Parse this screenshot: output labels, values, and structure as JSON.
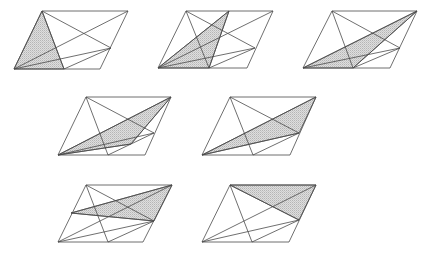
{
  "caption_fragment": "",
  "style": {
    "stroke": "#4a4a4a",
    "shade": "#cccccc"
  },
  "figures": [
    {
      "id": "fig1",
      "points": {
        "A": [
          14,
          69
        ],
        "B": [
          100,
          69
        ],
        "C": [
          128,
          11
        ],
        "D": [
          42,
          11
        ],
        "E": [
          64,
          69
        ],
        "F": [
          111,
          48
        ]
      },
      "lines": [
        [
          "A",
          "B"
        ],
        [
          "B",
          "C"
        ],
        [
          "C",
          "D"
        ],
        [
          "D",
          "A"
        ],
        [
          "D",
          "E"
        ],
        [
          "D",
          "F"
        ],
        [
          "A",
          "C"
        ],
        [
          "A",
          "F"
        ],
        [
          "E",
          "F"
        ]
      ],
      "shaded": [
        "A",
        "D",
        "E"
      ]
    },
    {
      "id": "fig2",
      "points": {
        "A": [
          158,
          68
        ],
        "B": [
          247,
          68
        ],
        "C": [
          273,
          11
        ],
        "D": [
          186,
          11
        ],
        "E": [
          209,
          68
        ],
        "F": [
          255,
          48
        ],
        "G": [
          229,
          11
        ]
      },
      "lines": [
        [
          "A",
          "B"
        ],
        [
          "B",
          "C"
        ],
        [
          "C",
          "D"
        ],
        [
          "D",
          "A"
        ],
        [
          "D",
          "E"
        ],
        [
          "D",
          "F"
        ],
        [
          "A",
          "C"
        ],
        [
          "A",
          "F"
        ],
        [
          "E",
          "F"
        ],
        [
          "A",
          "G"
        ],
        [
          "G",
          "E"
        ]
      ],
      "shaded": [
        "A",
        "G",
        "E"
      ]
    },
    {
      "id": "fig3",
      "points": {
        "A": [
          303,
          68
        ],
        "B": [
          390,
          68
        ],
        "C": [
          417,
          11
        ],
        "D": [
          332,
          11
        ],
        "E": [
          353,
          68
        ],
        "F": [
          400,
          48
        ]
      },
      "lines": [
        [
          "A",
          "B"
        ],
        [
          "B",
          "C"
        ],
        [
          "C",
          "D"
        ],
        [
          "D",
          "A"
        ],
        [
          "D",
          "E"
        ],
        [
          "D",
          "F"
        ],
        [
          "A",
          "C"
        ],
        [
          "A",
          "F"
        ],
        [
          "E",
          "F"
        ],
        [
          "E",
          "C"
        ]
      ],
      "shaded": [
        "A",
        "C",
        "E"
      ]
    },
    {
      "id": "fig4",
      "points": {
        "A": [
          58,
          155
        ],
        "B": [
          145,
          155
        ],
        "C": [
          171,
          97
        ],
        "D": [
          86,
          97
        ],
        "E": [
          108,
          155
        ],
        "F": [
          154,
          133
        ],
        "H": [
          131,
          144
        ]
      },
      "lines": [
        [
          "A",
          "B"
        ],
        [
          "B",
          "C"
        ],
        [
          "C",
          "D"
        ],
        [
          "D",
          "A"
        ],
        [
          "D",
          "E"
        ],
        [
          "D",
          "F"
        ],
        [
          "A",
          "C"
        ],
        [
          "A",
          "F"
        ],
        [
          "E",
          "F"
        ],
        [
          "A",
          "H"
        ],
        [
          "H",
          "C"
        ]
      ],
      "shaded": [
        "A",
        "C",
        "H"
      ]
    },
    {
      "id": "fig5",
      "points": {
        "A": [
          202,
          155
        ],
        "B": [
          290,
          155
        ],
        "C": [
          316,
          97
        ],
        "D": [
          230,
          97
        ],
        "E": [
          253,
          155
        ],
        "F": [
          299,
          133
        ]
      },
      "lines": [
        [
          "A",
          "B"
        ],
        [
          "B",
          "C"
        ],
        [
          "C",
          "D"
        ],
        [
          "D",
          "A"
        ],
        [
          "D",
          "E"
        ],
        [
          "D",
          "F"
        ],
        [
          "A",
          "C"
        ],
        [
          "A",
          "F"
        ],
        [
          "E",
          "F"
        ]
      ],
      "shaded": [
        "A",
        "C",
        "F"
      ]
    },
    {
      "id": "fig6",
      "points": {
        "A": [
          58,
          242
        ],
        "B": [
          143,
          242
        ],
        "C": [
          172,
          185
        ],
        "D": [
          86,
          185
        ],
        "E": [
          108,
          242
        ],
        "F": [
          154,
          221
        ],
        "G": [
          71,
          213
        ]
      },
      "lines": [
        [
          "A",
          "B"
        ],
        [
          "B",
          "C"
        ],
        [
          "C",
          "D"
        ],
        [
          "D",
          "A"
        ],
        [
          "D",
          "E"
        ],
        [
          "D",
          "F"
        ],
        [
          "A",
          "C"
        ],
        [
          "A",
          "F"
        ],
        [
          "E",
          "F"
        ],
        [
          "G",
          "C"
        ],
        [
          "G",
          "F"
        ]
      ],
      "shaded": [
        "G",
        "C",
        "F"
      ]
    },
    {
      "id": "fig7",
      "points": {
        "A": [
          202,
          242
        ],
        "B": [
          289,
          242
        ],
        "C": [
          316,
          185
        ],
        "D": [
          230,
          185
        ],
        "E": [
          252,
          242
        ],
        "F": [
          299,
          220
        ]
      },
      "lines": [
        [
          "A",
          "B"
        ],
        [
          "B",
          "C"
        ],
        [
          "C",
          "D"
        ],
        [
          "D",
          "A"
        ],
        [
          "D",
          "E"
        ],
        [
          "D",
          "F"
        ],
        [
          "A",
          "C"
        ],
        [
          "A",
          "F"
        ],
        [
          "E",
          "F"
        ]
      ],
      "shaded": [
        "D",
        "C",
        "F"
      ]
    }
  ]
}
